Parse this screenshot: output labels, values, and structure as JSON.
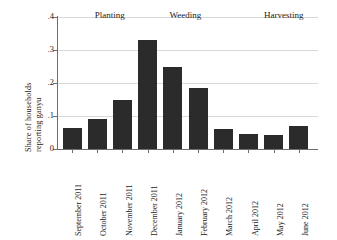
{
  "chart_data": {
    "type": "bar",
    "title": "",
    "subtitle": "",
    "xlabel": "",
    "ylabel_line1": "Share of households",
    "ylabel_line2": "reporting ganyu",
    "categories": [
      "September 2011",
      "October 2011",
      "November 2011",
      "December 2011",
      "January 2012",
      "February 2012",
      "March 2012",
      "April 2012",
      "May 2012",
      "June 2012"
    ],
    "values": [
      0.063,
      0.09,
      0.148,
      0.33,
      0.248,
      0.185,
      0.062,
      0.045,
      0.042,
      0.07
    ],
    "ylim": [
      0,
      0.4
    ],
    "ytick_values": [
      0,
      0.1,
      0.2,
      0.3,
      0.4
    ],
    "ytick_labels": [
      "0",
      ".1",
      ".2",
      ".3",
      ".4"
    ],
    "grid": "horizontal",
    "legend": "none",
    "bar_color": "#2b2b2b",
    "grid_color": "#d8d8d8",
    "axis_color": "#6e6e6e",
    "annotations": [
      {
        "label": "Planting",
        "center_category_index": 1.5
      },
      {
        "label": "Weeding",
        "center_category_index": 4.5
      },
      {
        "label": "Harvesting",
        "center_category_index": 8.4
      }
    ]
  }
}
